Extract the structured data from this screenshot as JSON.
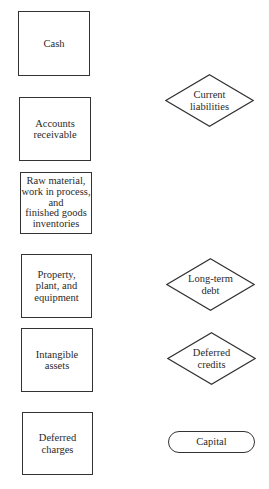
{
  "diagram": {
    "assets": [
      {
        "id": "cash",
        "label": "Cash",
        "shape": "rectangle"
      },
      {
        "id": "accounts-receivable",
        "label": "Accounts\nreceivable",
        "shape": "rectangle"
      },
      {
        "id": "inventories",
        "label": "Raw material,\nwork in process,\nand\nfinished goods\ninventories",
        "shape": "rectangle"
      },
      {
        "id": "property-plant-equipment",
        "label": "Property,\nplant, and\nequipment",
        "shape": "rectangle"
      },
      {
        "id": "intangible-assets",
        "label": "Intangible\nassets",
        "shape": "rectangle"
      },
      {
        "id": "deferred-charges",
        "label": "Deferred\ncharges",
        "shape": "rectangle"
      }
    ],
    "liabilities": [
      {
        "id": "current-liabilities",
        "label": "Current\nliabilities",
        "shape": "diamond"
      },
      {
        "id": "long-term-debt",
        "label": "Long-term\ndebt",
        "shape": "diamond"
      },
      {
        "id": "deferred-credits",
        "label": "Deferred\ncredits",
        "shape": "diamond"
      },
      {
        "id": "capital",
        "label": "Capital",
        "shape": "rounded-rectangle"
      }
    ],
    "colors": {
      "stroke": "#333333",
      "text": "#2a2a2a",
      "background": "#ffffff"
    }
  }
}
